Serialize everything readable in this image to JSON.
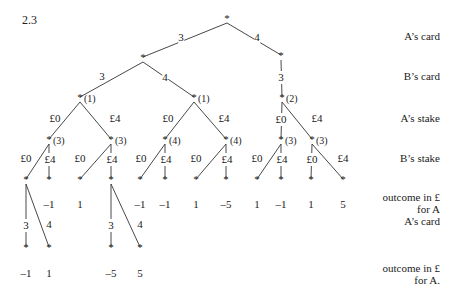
{
  "figure_label": "2.3",
  "node_marker": "*",
  "row_labels": [
    {
      "text": "A’s card",
      "y": 36
    },
    {
      "text": "B’s card",
      "y": 76
    },
    {
      "text": "A’s stake",
      "y": 118
    },
    {
      "text": "B’s stake",
      "y": 158
    },
    {
      "text": "outcome in £",
      "y": 197
    },
    {
      "text": "for A",
      "y": 209
    },
    {
      "text": "A’s card",
      "y": 221
    },
    {
      "text": "outcome in £",
      "y": 268
    },
    {
      "text": "for A.",
      "y": 280
    }
  ],
  "nodes": [
    {
      "id": "root",
      "x": 227,
      "y": 20
    },
    {
      "id": "a3",
      "x": 143,
      "y": 59
    },
    {
      "id": "a4",
      "x": 281,
      "y": 57
    },
    {
      "id": "n1a",
      "x": 80,
      "y": 99,
      "ann": "(1)"
    },
    {
      "id": "n1b",
      "x": 194,
      "y": 99,
      "ann": "(1)"
    },
    {
      "id": "n2",
      "x": 282,
      "y": 99,
      "ann": "(2)"
    },
    {
      "id": "n3a",
      "x": 49,
      "y": 141,
      "ann": "(3)"
    },
    {
      "id": "n3b",
      "x": 111,
      "y": 141,
      "ann": "(3)"
    },
    {
      "id": "n4a",
      "x": 165,
      "y": 141,
      "ann": "(4)"
    },
    {
      "id": "n4b",
      "x": 226,
      "y": 141,
      "ann": "(4)"
    },
    {
      "id": "n3c",
      "x": 281,
      "y": 141,
      "ann": "(3)"
    },
    {
      "id": "n3d",
      "x": 312,
      "y": 141,
      "ann": "(3)"
    },
    {
      "id": "l1",
      "x": 26,
      "y": 181
    },
    {
      "id": "l2",
      "x": 49,
      "y": 181
    },
    {
      "id": "l3",
      "x": 80,
      "y": 181
    },
    {
      "id": "l4",
      "x": 111,
      "y": 181
    },
    {
      "id": "l5",
      "x": 140,
      "y": 181
    },
    {
      "id": "l6",
      "x": 165,
      "y": 181
    },
    {
      "id": "l7",
      "x": 196,
      "y": 181
    },
    {
      "id": "l8",
      "x": 226,
      "y": 181
    },
    {
      "id": "l9",
      "x": 257,
      "y": 181
    },
    {
      "id": "l10",
      "x": 281,
      "y": 181
    },
    {
      "id": "l11",
      "x": 311,
      "y": 181
    },
    {
      "id": "l12",
      "x": 343,
      "y": 181
    },
    {
      "id": "f1",
      "x": 26,
      "y": 249
    },
    {
      "id": "f2",
      "x": 49,
      "y": 249
    },
    {
      "id": "f3",
      "x": 111,
      "y": 249
    },
    {
      "id": "f4",
      "x": 140,
      "y": 249
    }
  ],
  "edges": [
    {
      "from": "root",
      "to": "a3",
      "label": "3",
      "lx": 181,
      "ly": 36
    },
    {
      "from": "root",
      "to": "a4",
      "label": "4",
      "lx": 257,
      "ly": 36
    },
    {
      "from": "a3",
      "to": "n1a",
      "label": "3",
      "lx": 102,
      "ly": 76
    },
    {
      "from": "a3",
      "to": "n1b",
      "label": "4",
      "lx": 165,
      "ly": 76
    },
    {
      "from": "a4",
      "to": "n2",
      "label": "3",
      "lx": 281,
      "ly": 76
    },
    {
      "from": "n1a",
      "to": "n3a",
      "label": "£0",
      "lx": 55,
      "ly": 118
    },
    {
      "from": "n1a",
      "to": "n3b",
      "label": "£4",
      "lx": 115,
      "ly": 118
    },
    {
      "from": "n1b",
      "to": "n4a",
      "label": "£0",
      "lx": 168,
      "ly": 118
    },
    {
      "from": "n1b",
      "to": "n4b",
      "label": "£4",
      "lx": 224,
      "ly": 118
    },
    {
      "from": "n2",
      "to": "n3c",
      "label": "£0",
      "lx": 281,
      "ly": 118
    },
    {
      "from": "n2",
      "to": "n3d",
      "label": "£4",
      "lx": 317,
      "ly": 118
    },
    {
      "from": "n3a",
      "to": "l1",
      "label": "£0",
      "lx": 26,
      "ly": 158
    },
    {
      "from": "n3a",
      "to": "l2",
      "label": "£4",
      "lx": 50,
      "ly": 158
    },
    {
      "from": "n3b",
      "to": "l3",
      "label": "£0",
      "lx": 80,
      "ly": 158
    },
    {
      "from": "n3b",
      "to": "l4",
      "label": "£4",
      "lx": 112,
      "ly": 158
    },
    {
      "from": "n4a",
      "to": "l5",
      "label": "£0",
      "lx": 141,
      "ly": 158
    },
    {
      "from": "n4a",
      "to": "l6",
      "label": "£4",
      "lx": 166,
      "ly": 158
    },
    {
      "from": "n4b",
      "to": "l7",
      "label": "£0",
      "lx": 196,
      "ly": 158
    },
    {
      "from": "n4b",
      "to": "l8",
      "label": "£4",
      "lx": 227,
      "ly": 158
    },
    {
      "from": "n3c",
      "to": "l9",
      "label": "£0",
      "lx": 257,
      "ly": 158
    },
    {
      "from": "n3c",
      "to": "l10",
      "label": "£4",
      "lx": 282,
      "ly": 158
    },
    {
      "from": "n3d",
      "to": "l11",
      "label": "£0",
      "lx": 312,
      "ly": 158
    },
    {
      "from": "n3d",
      "to": "l12",
      "label": "£4",
      "lx": 343,
      "ly": 158
    },
    {
      "from": "l1",
      "to": "f1",
      "label": "3",
      "lx": 26,
      "ly": 224
    },
    {
      "from": "l1",
      "to": "f2",
      "label": "4",
      "lx": 49,
      "ly": 224
    },
    {
      "from": "l4",
      "to": "f3",
      "label": "3",
      "lx": 111,
      "ly": 224
    },
    {
      "from": "l4",
      "to": "f4",
      "label": "4",
      "lx": 140,
      "ly": 224
    }
  ],
  "outcomes_level1": [
    {
      "x": 49,
      "value": "–1"
    },
    {
      "x": 80,
      "value": "1"
    },
    {
      "x": 140,
      "value": "–1"
    },
    {
      "x": 165,
      "value": "–1"
    },
    {
      "x": 196,
      "value": "1"
    },
    {
      "x": 226,
      "value": "–5"
    },
    {
      "x": 257,
      "value": "1"
    },
    {
      "x": 281,
      "value": "–1"
    },
    {
      "x": 311,
      "value": "1"
    },
    {
      "x": 343,
      "value": "5"
    }
  ],
  "outcomes_level2": [
    {
      "x": 26,
      "value": "–1"
    },
    {
      "x": 49,
      "value": "1"
    },
    {
      "x": 111,
      "value": "–5"
    },
    {
      "x": 140,
      "value": "5"
    }
  ]
}
